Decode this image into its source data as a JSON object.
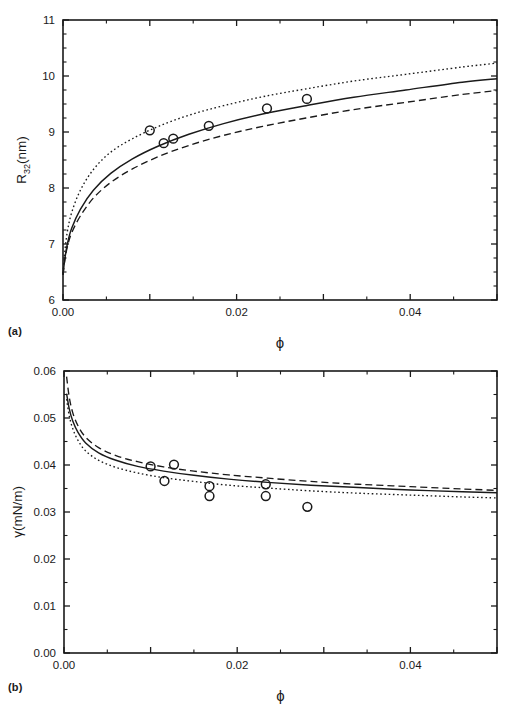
{
  "figure": {
    "panel_a_tag": "(a)",
    "panel_b_tag": "(b)"
  },
  "chart_data": [
    {
      "type": "scatter",
      "panel": "(a)",
      "title": "",
      "xlabel": "ϕ",
      "ylabel": "R32(nm)",
      "ylabel_base": "R",
      "ylabel_sub": "32",
      "ylabel_unit": "(nm)",
      "xlim": [
        0.0,
        0.05
      ],
      "ylim": [
        6,
        11
      ],
      "xticks": [
        0.0,
        0.01,
        0.02,
        0.03,
        0.04,
        0.05
      ],
      "xtick_labels": [
        "0.00",
        "",
        "0.02",
        "",
        "0.04",
        ""
      ],
      "yticks": [
        6,
        7,
        8,
        9,
        10,
        11
      ],
      "ytick_labels": [
        "6",
        "7",
        "8",
        "9",
        "10",
        "11"
      ],
      "grid": false,
      "legend": "none",
      "series": [
        {
          "name": "experimental data",
          "style": "open-circle",
          "x": [
            0.01,
            0.0116,
            0.0127,
            0.0168,
            0.0235,
            0.0281
          ],
          "y": [
            9.03,
            8.8,
            8.88,
            9.11,
            9.42,
            9.59
          ]
        },
        {
          "name": "model solid",
          "style": "solid",
          "x": [
            0.0,
            0.0002,
            0.0005,
            0.001,
            0.002,
            0.0035,
            0.0055,
            0.008,
            0.011,
            0.0145,
            0.0185,
            0.023,
            0.028,
            0.0335,
            0.0395,
            0.046,
            0.05
          ],
          "y": [
            6.45,
            6.72,
            7.0,
            7.28,
            7.62,
            7.96,
            8.26,
            8.52,
            8.75,
            8.96,
            9.15,
            9.32,
            9.47,
            9.62,
            9.75,
            9.89,
            9.95
          ]
        },
        {
          "name": "model dashed",
          "style": "dashed",
          "x": [
            0.0,
            0.0002,
            0.0005,
            0.001,
            0.002,
            0.0035,
            0.0055,
            0.008,
            0.011,
            0.0145,
            0.0185,
            0.023,
            0.028,
            0.0335,
            0.0395,
            0.046,
            0.05
          ],
          "y": [
            6.45,
            6.7,
            6.95,
            7.2,
            7.5,
            7.82,
            8.1,
            8.34,
            8.56,
            8.76,
            8.94,
            9.1,
            9.25,
            9.4,
            9.53,
            9.67,
            9.74
          ]
        },
        {
          "name": "model dotted",
          "style": "dotted",
          "x": [
            0.0,
            0.0002,
            0.0005,
            0.001,
            0.002,
            0.0035,
            0.0055,
            0.008,
            0.011,
            0.0145,
            0.0185,
            0.023,
            0.028,
            0.0335,
            0.0395,
            0.046,
            0.05
          ],
          "y": [
            6.48,
            6.85,
            7.22,
            7.56,
            7.96,
            8.33,
            8.64,
            8.88,
            9.1,
            9.3,
            9.47,
            9.63,
            9.77,
            9.91,
            10.03,
            10.16,
            10.23
          ]
        }
      ]
    },
    {
      "type": "scatter",
      "panel": "(b)",
      "title": "",
      "xlabel": "ϕ",
      "ylabel": "γ(mN/m)",
      "xlim": [
        0.0,
        0.05
      ],
      "ylim": [
        0.0,
        0.06
      ],
      "xticks": [
        0.0,
        0.01,
        0.02,
        0.03,
        0.04,
        0.05
      ],
      "xtick_labels": [
        "0.00",
        "",
        "0.02",
        "",
        "0.04",
        ""
      ],
      "yticks": [
        0.0,
        0.01,
        0.02,
        0.03,
        0.04,
        0.05,
        0.06
      ],
      "ytick_labels": [
        "0.00",
        "0.01",
        "0.02",
        "0.03",
        "0.04",
        "0.05",
        "0.06"
      ],
      "grid": false,
      "legend": "none",
      "series": [
        {
          "name": "experimental data",
          "style": "open-circle",
          "x": [
            0.01,
            0.0116,
            0.0127,
            0.0168,
            0.0168,
            0.0233,
            0.0233,
            0.0281
          ],
          "y": [
            0.0397,
            0.0366,
            0.0401,
            0.0355,
            0.0334,
            0.0359,
            0.0334,
            0.0311
          ]
        },
        {
          "name": "model solid",
          "style": "solid",
          "x": [
            0.0003,
            0.0006,
            0.001,
            0.0016,
            0.0025,
            0.004,
            0.006,
            0.0085,
            0.0115,
            0.015,
            0.019,
            0.0235,
            0.0285,
            0.034,
            0.04,
            0.046,
            0.05
          ],
          "y": [
            0.0552,
            0.052,
            0.0494,
            0.047,
            0.0447,
            0.0426,
            0.041,
            0.0397,
            0.0387,
            0.0378,
            0.037,
            0.0363,
            0.0357,
            0.0352,
            0.0347,
            0.0343,
            0.0341
          ]
        },
        {
          "name": "model dashed",
          "style": "dashed",
          "x": [
            0.0003,
            0.0006,
            0.001,
            0.0016,
            0.0025,
            0.004,
            0.006,
            0.0085,
            0.0115,
            0.015,
            0.019,
            0.0235,
            0.0285,
            0.034,
            0.04,
            0.046,
            0.05
          ],
          "y": [
            0.0588,
            0.0545,
            0.0512,
            0.0484,
            0.0459,
            0.0437,
            0.042,
            0.0407,
            0.0396,
            0.0387,
            0.0379,
            0.0372,
            0.0365,
            0.0359,
            0.0354,
            0.0349,
            0.0346
          ]
        },
        {
          "name": "model dotted",
          "style": "dotted",
          "x": [
            0.0003,
            0.0006,
            0.001,
            0.0016,
            0.0025,
            0.004,
            0.006,
            0.0085,
            0.0115,
            0.015,
            0.019,
            0.0235,
            0.0285,
            0.034,
            0.04,
            0.046,
            0.05
          ],
          "y": [
            0.054,
            0.0505,
            0.0478,
            0.0453,
            0.043,
            0.041,
            0.0395,
            0.0383,
            0.0373,
            0.0365,
            0.0357,
            0.0351,
            0.0345,
            0.034,
            0.0336,
            0.0332,
            0.033
          ]
        }
      ]
    }
  ]
}
